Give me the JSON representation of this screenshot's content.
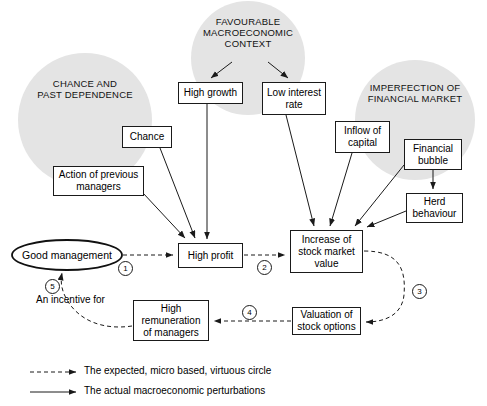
{
  "diagram": {
    "clouds": [
      {
        "id": "chance-past-dependence",
        "label": "CHANCE AND\nPAST DEPENDENCE",
        "line1": "CHANCE AND",
        "line2": "PAST DEPENDENCE",
        "cx": 85,
        "cy": 120,
        "r": 67
      },
      {
        "id": "favourable-macroeconomic-context",
        "label": "FAVOURABLE MACROECONOMIC CONTEXT",
        "line1": "FAVOURABLE",
        "line2": "MACROECONOMIC",
        "line3": "CONTEXT",
        "cx": 248,
        "cy": 58,
        "r": 57
      },
      {
        "id": "imperfection-of-financial-market",
        "label": "IMPERFECTION OF FINANCIAL MARKET",
        "line1": "IMPERFECTION OF",
        "line2": "FINANCIAL MARKET",
        "cx": 415,
        "cy": 120,
        "r": 60
      }
    ],
    "nodes": [
      {
        "id": "high-growth",
        "label": "High growth",
        "x": 178,
        "y": 82,
        "w": 65,
        "h": 22
      },
      {
        "id": "low-interest-rate",
        "label": "Low interest rate",
        "x": 262,
        "y": 82,
        "w": 64,
        "h": 33
      },
      {
        "id": "chance",
        "label": "Chance",
        "x": 122,
        "y": 126,
        "w": 50,
        "h": 22
      },
      {
        "id": "inflow-of-capital",
        "label": "Inflow of capital",
        "x": 335,
        "y": 121,
        "w": 55,
        "h": 32
      },
      {
        "id": "financial-bubble",
        "label": "Financial bubble",
        "x": 404,
        "y": 139,
        "w": 58,
        "h": 31
      },
      {
        "id": "action-of-previous-managers",
        "label": "Action of previous managers",
        "x": 53,
        "y": 166,
        "w": 91,
        "h": 30
      },
      {
        "id": "herd-behaviour",
        "label": "Herd behaviour",
        "x": 406,
        "y": 193,
        "w": 57,
        "h": 30
      },
      {
        "id": "high-profit",
        "label": "High profit",
        "x": 178,
        "y": 243,
        "w": 65,
        "h": 25
      },
      {
        "id": "increase-of-stock-market-value",
        "label": "Increase of stock market value",
        "x": 290,
        "y": 230,
        "w": 73,
        "h": 43
      },
      {
        "id": "valuation-of-stock-options",
        "label": "Valuation of stock options",
        "x": 292,
        "y": 307,
        "w": 69,
        "h": 28
      },
      {
        "id": "high-remuneration-of-managers",
        "label": "High remuneration of managers",
        "x": 133,
        "y": 300,
        "w": 76,
        "h": 41
      }
    ],
    "ellipse": {
      "id": "good-management",
      "label": "Good management",
      "cx": 67,
      "cy": 255,
      "rx": 55,
      "ry": 15
    },
    "markers": [
      {
        "id": "marker-1",
        "label": "1",
        "x": 118,
        "y": 261
      },
      {
        "id": "marker-2",
        "label": "2",
        "x": 257,
        "y": 260
      },
      {
        "id": "marker-3",
        "label": "3",
        "x": 412,
        "y": 284
      },
      {
        "id": "marker-4",
        "label": "4",
        "x": 242,
        "y": 305
      },
      {
        "id": "marker-5",
        "label": "5",
        "x": 45,
        "y": 279
      }
    ],
    "annotations": [
      {
        "id": "an-incentive-for",
        "label": "An incentive for",
        "x": 36,
        "y": 294
      }
    ],
    "legend": [
      {
        "id": "legend-expected",
        "label": "The expected, micro based, virtuous circle",
        "style": "dashed",
        "y": 372
      },
      {
        "id": "legend-actual",
        "label": "The actual macroeconomic perturbations",
        "style": "solid",
        "y": 392
      }
    ],
    "colors": {
      "cloud_fill": "#e4e4e4",
      "stroke": "#1a1a1a",
      "background": "#ffffff"
    }
  }
}
